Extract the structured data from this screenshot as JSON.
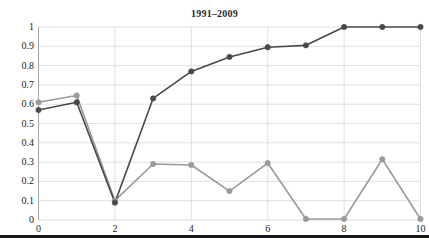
{
  "figure": {
    "title": "1991–2009",
    "background_color": "#ffffff",
    "page_rule": {
      "name": "page-separator-rule",
      "y": 235,
      "height": 3,
      "color": "#151515"
    }
  },
  "chart_data": {
    "type": "line",
    "title": "1991–2009",
    "xlabel": "",
    "ylabel": "",
    "x": [
      0,
      1,
      2,
      3,
      4,
      5,
      6,
      7,
      8,
      9,
      10
    ],
    "xlim": [
      0,
      10
    ],
    "ylim": [
      0,
      1
    ],
    "xticks": [
      0,
      2,
      4,
      6,
      8,
      10
    ],
    "xtick_labels": [
      "0",
      "2",
      "4",
      "6",
      "8",
      "10"
    ],
    "yticks": [
      0,
      0.1,
      0.2,
      0.3,
      0.4,
      0.5,
      0.6,
      0.7,
      0.8,
      0.9,
      1
    ],
    "ytick_labels": [
      "0",
      "0.1",
      "0.2",
      "0.3",
      "0.4",
      "0.5",
      "0.6",
      "0.7",
      "0.8",
      "0.9",
      "1"
    ],
    "grid": true,
    "grid_color": "#d8d8d8",
    "legend": "none",
    "markers": "circle",
    "series": [
      {
        "name": "dark-series",
        "color": "#4a4a4a",
        "values": [
          0.57,
          0.61,
          0.09,
          0.63,
          0.77,
          0.845,
          0.895,
          0.905,
          1.0,
          1.0,
          1.0
        ]
      },
      {
        "name": "light-series",
        "color": "#9a9a9a",
        "values": [
          0.61,
          0.645,
          0.1,
          0.29,
          0.285,
          0.15,
          0.295,
          0.005,
          0.005,
          0.315,
          0.005
        ]
      }
    ]
  }
}
